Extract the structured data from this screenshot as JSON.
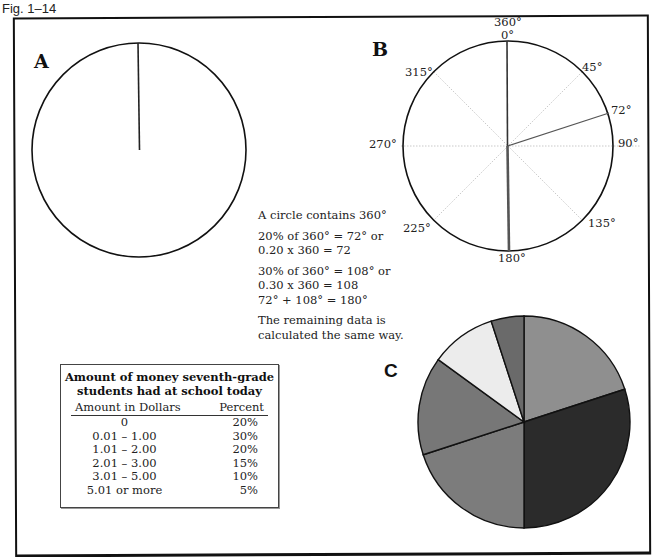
{
  "figure": {
    "label": "Fig. 1–14"
  },
  "panels": {
    "a": {
      "letter": "A"
    },
    "b": {
      "letter": "B",
      "degree_labels": {
        "top_360": "360°",
        "top_0": "0°",
        "d45": "45°",
        "d72": "72°",
        "d90": "90°",
        "d135": "135°",
        "d180": "180°",
        "d225": "225°",
        "d270": "270°",
        "d315": "315°"
      }
    },
    "c": {
      "letter": "C"
    }
  },
  "explanation": {
    "line1": "A circle contains 360°",
    "line2a": "20% of 360° = 72° or",
    "line2b": "0.20 x 360 = 72",
    "line3a": "30% of 360° = 108° or",
    "line3b": "0.30 x 360 = 108",
    "line3c": "72° + 108° = 180°",
    "line4a": "The remaining data is",
    "line4b": "calculated the same way."
  },
  "table": {
    "title_line1": "Amount of money seventh-grade",
    "title_line2": "students had at school today",
    "headers": {
      "amount": "Amount in Dollars",
      "percent": "Percent"
    },
    "rows": [
      {
        "amount": "0",
        "percent": "20%"
      },
      {
        "amount": "0.01 – 1.00",
        "percent": "30%"
      },
      {
        "amount": "1.01 – 2.00",
        "percent": "20%"
      },
      {
        "amount": "2.01 – 3.00",
        "percent": "15%"
      },
      {
        "amount": "3.01 – 5.00",
        "percent": "10%"
      },
      {
        "amount": "5.01 or more",
        "percent": "5%"
      }
    ]
  },
  "chart_data": {
    "type": "pie",
    "title": "Amount of money seventh-grade students had at school today",
    "categories": [
      "0",
      "0.01 – 1.00",
      "1.01 – 2.00",
      "2.01 – 3.00",
      "3.01 – 5.00",
      "5.01 or more"
    ],
    "values": [
      20,
      30,
      20,
      15,
      10,
      5
    ],
    "units": "percent",
    "start_angle_deg": 0,
    "direction": "clockwise",
    "slice_colors": [
      "#8f8f8f",
      "#2b2b2b",
      "#7c7c7c",
      "#777777",
      "#ececec",
      "#6a6a6a"
    ],
    "construction_angles_deg": [
      0,
      72,
      180,
      252,
      306,
      342,
      360
    ]
  }
}
